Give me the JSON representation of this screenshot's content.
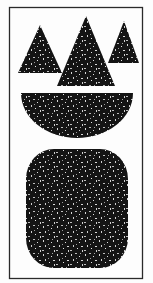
{
  "artwork": {
    "background_color": "#fdfdfd",
    "frame_color": "#2a2a2a",
    "shape_fill": "#141414",
    "speckle_color": "#d8d8d8",
    "shapes": [
      {
        "type": "triangle",
        "name": "small-left-triangle"
      },
      {
        "type": "triangle",
        "name": "large-center-triangle"
      },
      {
        "type": "triangle",
        "name": "small-right-triangle"
      },
      {
        "type": "half-disc",
        "name": "half-disc-bowl"
      },
      {
        "type": "rounded-square",
        "name": "rounded-square-block"
      }
    ]
  }
}
